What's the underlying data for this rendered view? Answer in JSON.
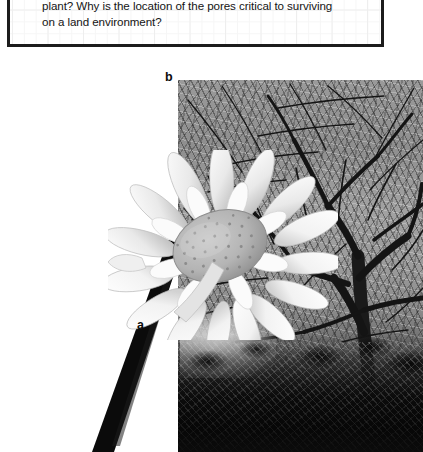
{
  "question_box": {
    "text": "plant? Why is the location of the pores critical to surviving\non a land environment?",
    "border_color": "#1c1c1c",
    "grid_color": "#eeeeee"
  },
  "figure": {
    "label": "Figure 21.3",
    "label_color": "#7d8792",
    "caption": "Stems can be soft and\nflexible like the daisy\nstem shown here (a).\nOther plants, such as\nthis sugar maple tree,\nhave strong, thick\nstems that provide\nsupport and\nallow the tree\nto grow to great\nheights (b).",
    "panel_labels": {
      "a": "a",
      "b": "b"
    },
    "images": {
      "daisy": {
        "name": "daisy-flower-photo",
        "description": "black and white close-up of a white daisy flower with a dark stem, panel a"
      },
      "tree": {
        "name": "sugar-maple-tree-photo",
        "description": "black and white photograph of a large bare sugar maple tree with dense branches and dark shrubs at its base, panel b"
      }
    }
  }
}
